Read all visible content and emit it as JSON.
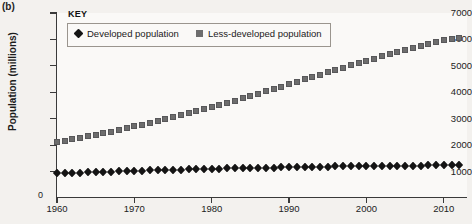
{
  "figure": {
    "panel_label": "(b)"
  },
  "key": {
    "title": "KEY",
    "entries": [
      {
        "label": "Developed population",
        "marker": "diamond-marker-icon",
        "color": "#141414"
      },
      {
        "label": "Less-developed population",
        "marker": "square-marker-icon",
        "color": "#6d6d6d"
      }
    ]
  },
  "axes": {
    "ylabel": "Population (millions)",
    "zero_label": "0",
    "yticks": [
      "1000",
      "2000",
      "3000",
      "4000",
      "5000",
      "6000",
      "7000"
    ],
    "xticks": [
      "1960",
      "1970",
      "1980",
      "1990",
      "2000",
      "2010"
    ]
  },
  "chart_data": {
    "type": "scatter",
    "title": "",
    "xlabel": "",
    "ylabel": "Population (millions)",
    "xlim": [
      1960,
      2013
    ],
    "ylim": [
      0,
      7000
    ],
    "grid": false,
    "legend_position": "top-left",
    "x": [
      1960,
      1961,
      1962,
      1963,
      1964,
      1965,
      1966,
      1967,
      1968,
      1969,
      1970,
      1971,
      1972,
      1973,
      1974,
      1975,
      1976,
      1977,
      1978,
      1979,
      1980,
      1981,
      1982,
      1983,
      1984,
      1985,
      1986,
      1987,
      1988,
      1989,
      1990,
      1991,
      1992,
      1993,
      1994,
      1995,
      1996,
      1997,
      1998,
      1999,
      2000,
      2001,
      2002,
      2003,
      2004,
      2005,
      2006,
      2007,
      2008,
      2009,
      2010,
      2011,
      2012
    ],
    "series": [
      {
        "name": "Developed population",
        "marker": "diamond",
        "color": "#141414",
        "values": [
          930,
          941,
          952,
          963,
          973,
          983,
          992,
          1001,
          1010,
          1019,
          1028,
          1037,
          1045,
          1053,
          1061,
          1068,
          1075,
          1082,
          1089,
          1096,
          1103,
          1110,
          1117,
          1124,
          1130,
          1136,
          1142,
          1148,
          1154,
          1160,
          1166,
          1171,
          1176,
          1180,
          1184,
          1188,
          1192,
          1196,
          1199,
          1202,
          1206,
          1209,
          1212,
          1215,
          1218,
          1221,
          1224,
          1227,
          1230,
          1234,
          1238,
          1242,
          1246
        ]
      },
      {
        "name": "Less-developed population",
        "marker": "square",
        "color": "#6d6d6d",
        "values": [
          2120,
          2170,
          2222,
          2277,
          2334,
          2392,
          2452,
          2514,
          2577,
          2642,
          2708,
          2776,
          2845,
          2915,
          2986,
          3058,
          3131,
          3205,
          3281,
          3359,
          3438,
          3519,
          3602,
          3686,
          3771,
          3857,
          3945,
          4034,
          4124,
          4214,
          4305,
          4396,
          4487,
          4577,
          4667,
          4757,
          4846,
          4934,
          5021,
          5107,
          5192,
          5276,
          5359,
          5441,
          5522,
          5602,
          5681,
          5759,
          5836,
          5912,
          5987,
          6020,
          6060
        ]
      }
    ]
  }
}
